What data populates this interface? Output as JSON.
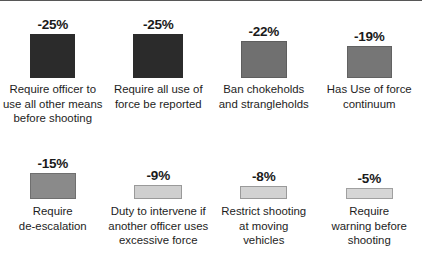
{
  "chart_data": {
    "type": "bar",
    "title": "",
    "subtitle": "",
    "xlabel": "",
    "ylabel": "",
    "grid": false,
    "legend": "none",
    "orientation": "vertical",
    "value_suffix": "%",
    "categories": [
      "Require officer to use all other means before shooting",
      "Require all use of force be reported",
      "Ban chokeholds and strangleholds",
      "Has Use of force continuum",
      "Require de-escalation",
      "Duty to intervene if another officer uses excessive force",
      "Restrict shooting at moving vehicles",
      "Require warning before shooting"
    ],
    "values": [
      -25,
      -25,
      -22,
      -19,
      -15,
      -9,
      -8,
      -5
    ],
    "value_labels": [
      "-25%",
      "-25%",
      "-22%",
      "-19%",
      "-15%",
      "-9%",
      "-8%",
      "-5%"
    ],
    "ylim": [
      -25,
      0
    ],
    "bars": [
      {
        "id": "bar-require-officer-other-means",
        "value": -25,
        "value_label": "-25%",
        "caption_lines": [
          "Require officer to",
          "use all other means",
          "before shooting"
        ],
        "fill": "#2b2b2b",
        "border": "#2b2b2b",
        "width_px": 45,
        "height_px": 44
      },
      {
        "id": "bar-require-all-force-reported",
        "value": -25,
        "value_label": "-25%",
        "caption_lines": [
          "Require all use of",
          "force be reported"
        ],
        "fill": "#2b2b2b",
        "border": "#2b2b2b",
        "width_px": 50,
        "height_px": 44
      },
      {
        "id": "bar-ban-chokeholds",
        "value": -22,
        "value_label": "-22%",
        "caption_lines": [
          "Ban chokeholds",
          "and strangleholds"
        ],
        "fill": "#707070",
        "border": "#5e5e5e",
        "width_px": 46,
        "height_px": 37
      },
      {
        "id": "bar-use-of-force-continuum",
        "value": -19,
        "value_label": "-19%",
        "caption_lines": [
          "Has Use of force",
          "continuum"
        ],
        "fill": "#767676",
        "border": "#626262",
        "width_px": 45,
        "height_px": 32
      },
      {
        "id": "bar-require-de-escalation",
        "value": -15,
        "value_label": "-15%",
        "caption_lines": [
          "Require",
          "de-escalation"
        ],
        "fill": "#8a8a8a",
        "border": "#6f6f6f",
        "width_px": 46,
        "height_px": 26
      },
      {
        "id": "bar-duty-to-intervene",
        "value": -9,
        "value_label": "-9%",
        "caption_lines": [
          "Duty to intervene if",
          "another officer uses",
          "excessive force"
        ],
        "fill": "#cfcfcf",
        "border": "#9a9a9a",
        "width_px": 48,
        "height_px": 14
      },
      {
        "id": "bar-restrict-shooting-moving-vehicles",
        "value": -8,
        "value_label": "-8%",
        "caption_lines": [
          "Restrict shooting",
          "at moving",
          "vehicles"
        ],
        "fill": "#d2d2d2",
        "border": "#9a9a9a",
        "width_px": 47,
        "height_px": 13
      },
      {
        "id": "bar-require-warning-before-shooting",
        "value": -5,
        "value_label": "-5%",
        "caption_lines": [
          "Require",
          "warning before",
          "shooting"
        ],
        "fill": "#d6d6d6",
        "border": "#a0a0a0",
        "width_px": 47,
        "height_px": 11
      }
    ]
  },
  "colors": {
    "background": "#ffffff",
    "text": "#1d1d1d",
    "value_text": "#1a1a1a",
    "top_rule": "#3a3a3a"
  }
}
